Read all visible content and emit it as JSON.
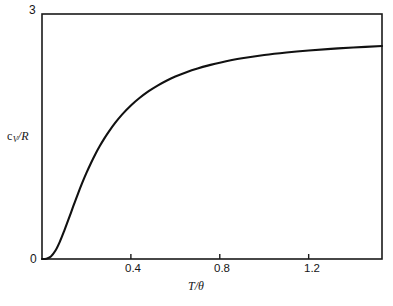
{
  "chart_data": {
    "type": "line",
    "title": "",
    "subtitle": "",
    "xlabel": "T/θ",
    "ylabel": "cᵥ/R",
    "ylabel_parts": {
      "base": "c",
      "sub": "V",
      "rest": "/R"
    },
    "xlim": [
      0,
      1.53
    ],
    "ylim": [
      0,
      3
    ],
    "grid": false,
    "legend": null,
    "x_ticks": [
      {
        "value": 0,
        "label": "0"
      },
      {
        "value": 0.4,
        "label": "0.4"
      },
      {
        "value": 0.8,
        "label": "0.8"
      },
      {
        "value": 1.2,
        "label": "1.2"
      }
    ],
    "y_ticks": [
      {
        "value": 0,
        "label": "0"
      },
      {
        "value": 3,
        "label": "3"
      }
    ],
    "series": [
      {
        "name": "Debye heat capacity",
        "x": [
          0.0,
          0.02,
          0.04,
          0.06,
          0.08,
          0.1,
          0.12,
          0.14,
          0.16,
          0.18,
          0.2,
          0.22,
          0.24,
          0.26,
          0.28,
          0.3,
          0.33,
          0.36,
          0.4,
          0.44,
          0.48,
          0.52,
          0.56,
          0.6,
          0.65,
          0.7,
          0.75,
          0.8,
          0.9,
          1.0,
          1.1,
          1.2,
          1.3,
          1.4,
          1.53
        ],
        "y": [
          0.0,
          0.004,
          0.031,
          0.1,
          0.21,
          0.345,
          0.49,
          0.64,
          0.786,
          0.925,
          1.054,
          1.173,
          1.283,
          1.383,
          1.474,
          1.557,
          1.669,
          1.768,
          1.88,
          1.974,
          2.055,
          2.124,
          2.183,
          2.234,
          2.288,
          2.333,
          2.371,
          2.404,
          2.457,
          2.497,
          2.528,
          2.553,
          2.573,
          2.59,
          2.608
        ]
      }
    ]
  },
  "geometry": {
    "plot_left": 42,
    "plot_right": 382,
    "plot_top": 14,
    "plot_bottom": 259,
    "frame_color": "#1a1a1a",
    "curve_color": "#111111"
  }
}
